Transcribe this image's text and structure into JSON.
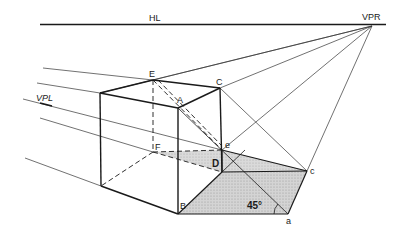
{
  "diagram": {
    "type": "two-point perspective construction",
    "horizon_label": "HL",
    "vanishing_point_right_label": "VPR",
    "vanishing_point_left_label": "VPL",
    "vertices": {
      "E": "E",
      "C": "C",
      "A": "A",
      "F": "F",
      "e": "e",
      "D": "D",
      "B": "B",
      "c": "c",
      "a": "a"
    },
    "angle_label": "45°",
    "colors": {
      "line": "#1a1a1a",
      "shade": "#c8c8c8",
      "background": "#ffffff"
    }
  }
}
